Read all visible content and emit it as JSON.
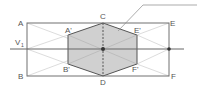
{
  "diagram": {
    "type": "geometric-projection",
    "colors": {
      "line": "#666666",
      "thin_line": "#bbbbbb",
      "hexagon_fill": "#cfcfcf",
      "hexagon_stroke": "#555555",
      "point": "#333333"
    },
    "labels": {
      "A": "A",
      "B": "B",
      "C": "C",
      "D": "D",
      "E": "E",
      "F": "F",
      "A_prime": "A'",
      "B_prime": "B'",
      "E_prime": "E'",
      "F_prime": "F'",
      "V": "V",
      "V_sub": "1"
    }
  }
}
